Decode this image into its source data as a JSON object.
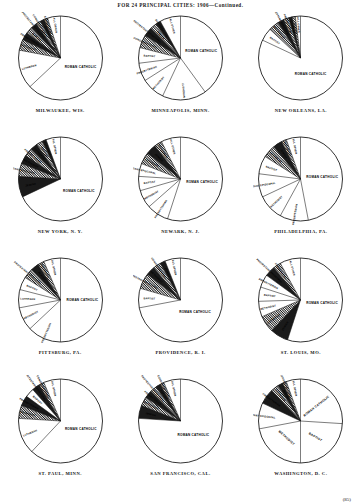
{
  "header": {
    "title": "FOR 24 PRINCIPAL CITIES: 1906—Continued."
  },
  "page_number": "(85)",
  "chart_data": [
    {
      "type": "pie",
      "title": "MILWAUKEE, WIS.",
      "start_angle": -90,
      "radius_style": "full",
      "labels_outside": false,
      "slices": [
        {
          "label": "ROMAN CATHOLIC",
          "value": 63.0,
          "placement": "inside-left",
          "shade": "none"
        },
        {
          "label": "LUTHERAN",
          "value": 15.0,
          "placement": "radial",
          "shade": "none"
        },
        {
          "label": "METHODIST",
          "value": 4.2,
          "placement": "radial",
          "shade": "hatch"
        },
        {
          "label": "PRESBYTERIAN",
          "value": 3.0,
          "placement": "radial",
          "shade": "dark"
        },
        {
          "label": "BAPTIST",
          "value": 2.6,
          "placement": "radial",
          "shade": "hatch"
        },
        {
          "label": "PROTESTANT EPISCOPAL",
          "value": 2.4,
          "placement": "radial",
          "shade": "dark"
        },
        {
          "label": "CONGREGATIONAL",
          "value": 1.8,
          "placement": "radial",
          "shade": "hatch"
        },
        {
          "label": "JEWISH",
          "value": 1.6,
          "placement": "radial",
          "shade": "dark"
        },
        {
          "label": "EVANGELICAL",
          "value": 1.4,
          "placement": "radial",
          "shade": "hatch"
        },
        {
          "label": "ALL OTHER",
          "value": 5.0,
          "placement": "radial",
          "shade": "none"
        }
      ]
    },
    {
      "type": "pie",
      "title": "MINNEAPOLIS, MINN.",
      "start_angle": -90,
      "radius_style": "full",
      "slices": [
        {
          "label": "ROMAN CATHOLIC",
          "value": 40.0,
          "placement": "inside-left",
          "shade": "none"
        },
        {
          "label": "LUTHERAN",
          "value": 17.0,
          "placement": "radial",
          "shade": "none"
        },
        {
          "label": "METHODIST",
          "value": 9.0,
          "placement": "radial",
          "shade": "none"
        },
        {
          "label": "PRESBYTERIAN",
          "value": 7.0,
          "placement": "radial",
          "shade": "none"
        },
        {
          "label": "BAPTIST",
          "value": 6.0,
          "placement": "radial",
          "shade": "none"
        },
        {
          "label": "CONGREGATIONAL",
          "value": 5.0,
          "placement": "radial",
          "shade": "hatch"
        },
        {
          "label": "PROTESTANT EPISCOPAL",
          "value": 3.5,
          "placement": "radial",
          "shade": "dark"
        },
        {
          "label": "JEWISH",
          "value": 2.5,
          "placement": "radial",
          "shade": "hatch"
        },
        {
          "label": "SCANDINAVIAN",
          "value": 2.0,
          "placement": "radial",
          "shade": "dark"
        },
        {
          "label": "ALL OTHER",
          "value": 8.0,
          "placement": "radial",
          "shade": "none"
        }
      ]
    },
    {
      "type": "pie",
      "title": "NEW ORLEANS, LA.",
      "start_angle": -90,
      "radius_style": "full",
      "slices": [
        {
          "label": "ROMAN CATHOLIC",
          "value": 82.0,
          "placement": "inside-center",
          "shade": "none"
        },
        {
          "label": "BAPTIST",
          "value": 5.0,
          "placement": "radial",
          "shade": "none"
        },
        {
          "label": "METHODIST",
          "value": 4.0,
          "placement": "radial",
          "shade": "hatch"
        },
        {
          "label": "PROTESTANT EPISCOPAL",
          "value": 2.4,
          "placement": "radial",
          "shade": "dark"
        },
        {
          "label": "PRESBYTERIAN",
          "value": 2.0,
          "placement": "radial",
          "shade": "hatch"
        },
        {
          "label": "LUTHERAN",
          "value": 1.4,
          "placement": "radial",
          "shade": "dark"
        },
        {
          "label": "JEWISH",
          "value": 1.2,
          "placement": "radial",
          "shade": "hatch"
        },
        {
          "label": "ALL OTHER",
          "value": 2.0,
          "placement": "radial",
          "shade": "none"
        }
      ]
    },
    {
      "type": "pie",
      "title": "NEW YORK, N. Y.",
      "start_angle": -90,
      "radius_style": "full",
      "slices": [
        {
          "label": "ROMAN CATHOLIC",
          "value": 68.0,
          "placement": "inside-left",
          "shade": "none"
        },
        {
          "label": "JEWISH",
          "value": 8.0,
          "placement": "radial",
          "shade": "dark"
        },
        {
          "label": "PROTESTANT EPISCOPAL",
          "value": 5.0,
          "placement": "radial",
          "shade": "hatch"
        },
        {
          "label": "METHODIST",
          "value": 3.4,
          "placement": "radial",
          "shade": "dark"
        },
        {
          "label": "PRESBYTERIAN",
          "value": 3.2,
          "placement": "radial",
          "shade": "hatch"
        },
        {
          "label": "LUTHERAN",
          "value": 2.8,
          "placement": "radial",
          "shade": "dark"
        },
        {
          "label": "BAPTIST",
          "value": 2.4,
          "placement": "radial",
          "shade": "hatch"
        },
        {
          "label": "REFORMED",
          "value": 1.6,
          "placement": "radial",
          "shade": "dark"
        },
        {
          "label": "ALL OTHER",
          "value": 5.6,
          "placement": "radial",
          "shade": "none"
        }
      ]
    },
    {
      "type": "pie",
      "title": "NEWARK, N. J.",
      "start_angle": -90,
      "radius_style": "full",
      "slices": [
        {
          "label": "ROMAN CATHOLIC",
          "value": 55.0,
          "placement": "inside-left",
          "shade": "none"
        },
        {
          "label": "PRESBYTERIAN",
          "value": 8.5,
          "placement": "radial",
          "shade": "none"
        },
        {
          "label": "METHODIST",
          "value": 7.0,
          "placement": "radial",
          "shade": "none"
        },
        {
          "label": "BAPTIST",
          "value": 5.5,
          "placement": "radial",
          "shade": "none"
        },
        {
          "label": "PROTESTANT EPISCOPAL",
          "value": 5.0,
          "placement": "radial",
          "shade": "none"
        },
        {
          "label": "LUTHERAN",
          "value": 4.5,
          "placement": "radial",
          "shade": "hatch"
        },
        {
          "label": "JEWISH",
          "value": 4.0,
          "placement": "radial",
          "shade": "dark"
        },
        {
          "label": "REFORMED",
          "value": 3.0,
          "placement": "radial",
          "shade": "hatch"
        },
        {
          "label": "ALL OTHER",
          "value": 7.5,
          "placement": "radial",
          "shade": "none"
        }
      ]
    },
    {
      "type": "pie",
      "title": "PHILADELPHIA, PA.",
      "start_angle": -90,
      "radius_style": "full",
      "slices": [
        {
          "label": "ROMAN CATHOLIC",
          "value": 47.0,
          "placement": "inside-left",
          "shade": "none"
        },
        {
          "label": "PRESBYTERIAN",
          "value": 11.0,
          "placement": "radial",
          "shade": "none"
        },
        {
          "label": "METHODIST",
          "value": 10.0,
          "placement": "radial",
          "shade": "none"
        },
        {
          "label": "PROTESTANT EPISCOPAL",
          "value": 9.0,
          "placement": "radial",
          "shade": "none"
        },
        {
          "label": "BAPTIST",
          "value": 7.0,
          "placement": "radial",
          "shade": "none"
        },
        {
          "label": "LUTHERAN",
          "value": 5.0,
          "placement": "radial",
          "shade": "hatch"
        },
        {
          "label": "JEWISH",
          "value": 3.5,
          "placement": "radial",
          "shade": "dark"
        },
        {
          "label": "REFORMED",
          "value": 2.0,
          "placement": "radial",
          "shade": "hatch"
        },
        {
          "label": "ALL OTHER",
          "value": 5.5,
          "placement": "radial",
          "shade": "none"
        }
      ]
    },
    {
      "type": "pie",
      "title": "PITTSBURG, PA.",
      "start_angle": -90,
      "radius_style": "full",
      "slices": [
        {
          "label": "ROMAN CATHOLIC",
          "value": 50.0,
          "placement": "inside-left",
          "shade": "none"
        },
        {
          "label": "PRESBYTERIAN",
          "value": 13.0,
          "placement": "radial",
          "shade": "none"
        },
        {
          "label": "METHODIST",
          "value": 9.0,
          "placement": "radial",
          "shade": "none"
        },
        {
          "label": "LUTHERAN",
          "value": 7.0,
          "placement": "radial",
          "shade": "none"
        },
        {
          "label": "BAPTIST",
          "value": 5.0,
          "placement": "radial",
          "shade": "none"
        },
        {
          "label": "PROTESTANT EPISCOPAL",
          "value": 4.0,
          "placement": "radial",
          "shade": "hatch"
        },
        {
          "label": "JEWISH",
          "value": 3.0,
          "placement": "radial",
          "shade": "dark"
        },
        {
          "label": "REFORMED",
          "value": 2.5,
          "placement": "radial",
          "shade": "hatch"
        },
        {
          "label": "ALL OTHER",
          "value": 6.5,
          "placement": "radial",
          "shade": "none"
        }
      ]
    },
    {
      "type": "pie",
      "title": "PROVIDENCE, R. I.",
      "start_angle": -90,
      "radius_style": "full",
      "slices": [
        {
          "label": "ROMAN CATHOLIC",
          "value": 72.0,
          "placement": "inside-center",
          "shade": "none"
        },
        {
          "label": "BAPTIST",
          "value": 7.5,
          "placement": "radial",
          "shade": "none"
        },
        {
          "label": "PROTESTANT EPISCOPAL",
          "value": 6.0,
          "placement": "radial",
          "shade": "hatch"
        },
        {
          "label": "METHODIST",
          "value": 3.5,
          "placement": "radial",
          "shade": "dark"
        },
        {
          "label": "CONGREGATIONAL",
          "value": 3.0,
          "placement": "radial",
          "shade": "hatch"
        },
        {
          "label": "JEWISH",
          "value": 2.0,
          "placement": "radial",
          "shade": "dark"
        },
        {
          "label": "ALL OTHER",
          "value": 6.0,
          "placement": "radial",
          "shade": "none"
        }
      ]
    },
    {
      "type": "pie",
      "title": "ST. LOUIS, MO.",
      "start_angle": -90,
      "radius_style": "full",
      "slices": [
        {
          "label": "ROMAN CATHOLIC",
          "value": 55.0,
          "placement": "inside-left",
          "shade": "none"
        },
        {
          "label": "JEWISH",
          "value": 7.0,
          "placement": "radial",
          "shade": "dark"
        },
        {
          "label": "LUTHERAN",
          "value": 6.5,
          "placement": "radial",
          "shade": "hatch"
        },
        {
          "label": "METHODIST",
          "value": 6.0,
          "placement": "radial",
          "shade": "none"
        },
        {
          "label": "BAPTIST",
          "value": 5.5,
          "placement": "radial",
          "shade": "none"
        },
        {
          "label": "PRESBYTERIAN",
          "value": 5.0,
          "placement": "radial",
          "shade": "none"
        },
        {
          "label": "PROTESTANT EPISCOPAL",
          "value": 4.0,
          "placement": "radial",
          "shade": "dark"
        },
        {
          "label": "EVANGELICAL",
          "value": 3.0,
          "placement": "radial",
          "shade": "hatch"
        },
        {
          "label": "ALL OTHER",
          "value": 8.0,
          "placement": "radial",
          "shade": "none"
        }
      ]
    },
    {
      "type": "pie",
      "title": "ST. PAUL, MINN.",
      "start_angle": -90,
      "radius_style": "full",
      "slices": [
        {
          "label": "ROMAN CATHOLIC",
          "value": 62.0,
          "placement": "inside-left",
          "shade": "none"
        },
        {
          "label": "LUTHERAN",
          "value": 14.0,
          "placement": "radial",
          "shade": "none"
        },
        {
          "label": "METHODIST",
          "value": 5.0,
          "placement": "radial",
          "shade": "hatch"
        },
        {
          "label": "PRESBYTERIAN",
          "value": 4.0,
          "placement": "radial",
          "shade": "dark"
        },
        {
          "label": "BAPTIST",
          "value": 3.5,
          "placement": "radial",
          "shade": "none"
        },
        {
          "label": "PROTESTANT EPISCOPAL",
          "value": 3.0,
          "placement": "radial",
          "shade": "dark"
        },
        {
          "label": "CONGREGATIONAL",
          "value": 2.0,
          "placement": "radial",
          "shade": "hatch"
        },
        {
          "label": "ALL OTHER",
          "value": 6.5,
          "placement": "radial",
          "shade": "none"
        }
      ]
    },
    {
      "type": "pie",
      "title": "SAN FRANCISCO, CAL.",
      "start_angle": -90,
      "radius_style": "full",
      "slices": [
        {
          "label": "ROMAN CATHOLIC",
          "value": 76.0,
          "placement": "inside-center",
          "shade": "none"
        },
        {
          "label": "JEWISH",
          "value": 5.0,
          "placement": "radial",
          "shade": "dark"
        },
        {
          "label": "METHODIST",
          "value": 3.5,
          "placement": "radial",
          "shade": "hatch"
        },
        {
          "label": "PRESBYTERIAN",
          "value": 3.0,
          "placement": "radial",
          "shade": "dark"
        },
        {
          "label": "PROTESTANT EPISCOPAL",
          "value": 2.5,
          "placement": "radial",
          "shade": "hatch"
        },
        {
          "label": "BAPTIST",
          "value": 2.0,
          "placement": "radial",
          "shade": "dark"
        },
        {
          "label": "CONGREGATIONAL",
          "value": 1.5,
          "placement": "radial",
          "shade": "hatch"
        },
        {
          "label": "ALL OTHER",
          "value": 6.5,
          "placement": "radial",
          "shade": "none"
        }
      ]
    },
    {
      "type": "pie",
      "title": "WASHINGTON, D. C.",
      "start_angle": -90,
      "radius_style": "full",
      "slices": [
        {
          "label": "ROMAN CATHOLIC",
          "value": 26.0,
          "placement": "inside-upper-left",
          "shade": "none"
        },
        {
          "label": "BAPTIST",
          "value": 24.0,
          "placement": "inside-upper-right",
          "shade": "none"
        },
        {
          "label": "METHODIST",
          "value": 22.0,
          "placement": "inside-right",
          "shade": "none"
        },
        {
          "label": "PROTESTANT EPISCOPAL",
          "value": 10.0,
          "placement": "radial",
          "shade": "none"
        },
        {
          "label": "PRESBYTERIAN",
          "value": 6.0,
          "placement": "radial",
          "shade": "dark"
        },
        {
          "label": "LUTHERAN",
          "value": 3.0,
          "placement": "radial",
          "shade": "hatch"
        },
        {
          "label": "JEWISH",
          "value": 2.0,
          "placement": "radial",
          "shade": "dark"
        },
        {
          "label": "CONGREGATIONAL",
          "value": 1.5,
          "placement": "radial",
          "shade": "hatch"
        },
        {
          "label": "ALL OTHER",
          "value": 5.5,
          "placement": "radial",
          "shade": "none"
        }
      ]
    }
  ]
}
